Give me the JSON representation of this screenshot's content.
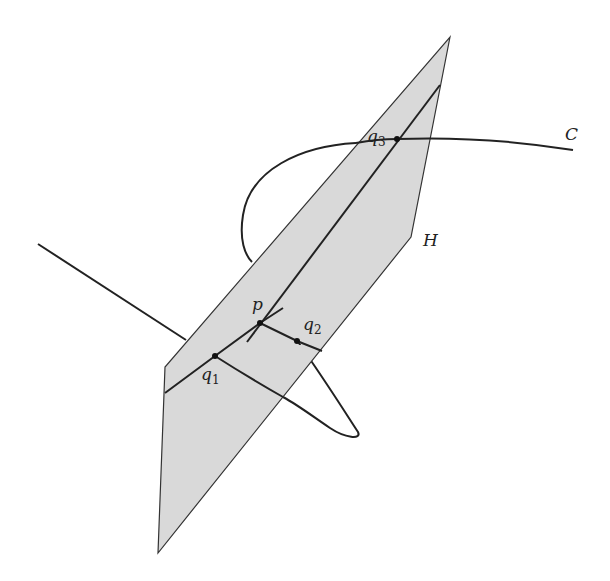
{
  "diagram": {
    "labels": {
      "C": "C",
      "H": "H",
      "p": "p",
      "q1": {
        "base": "q",
        "sub": "1"
      },
      "q2": {
        "base": "q",
        "sub": "2"
      },
      "q3": {
        "base": "q",
        "sub": "3"
      }
    },
    "colors": {
      "plane_fill": "#d9d9d9",
      "stroke": "#222222"
    }
  }
}
